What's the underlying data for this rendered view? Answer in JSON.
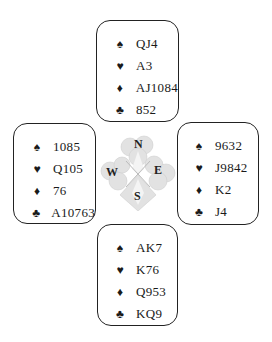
{
  "icons": {
    "spade": "♠",
    "heart": "♥",
    "diamond": "♦",
    "club": "♣"
  },
  "compass": {
    "north": "N",
    "west": "W",
    "east": "E",
    "south": "S"
  },
  "hands": {
    "north": {
      "spades": "QJ4",
      "hearts": "A3",
      "diamonds": "AJ1084",
      "clubs": "852"
    },
    "west": {
      "spades": "1085",
      "hearts": "Q105",
      "diamonds": "76",
      "clubs": "A10763"
    },
    "east": {
      "spades": "9632",
      "hearts": "J9842",
      "diamonds": "K2",
      "clubs": "J4"
    },
    "south": {
      "spades": "AK7",
      "hearts": "K76",
      "diamonds": "Q953",
      "clubs": "KQ9"
    }
  }
}
